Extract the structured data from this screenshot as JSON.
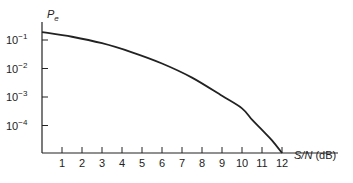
{
  "chart_data": {
    "type": "line",
    "title": "",
    "xlabel": "S/N (dB)",
    "ylabel": "P_e",
    "yscale": "log",
    "xlim": [
      0,
      12.8
    ],
    "ylim": [
      1e-05,
      0.3
    ],
    "x_ticks": [
      1,
      2,
      3,
      4,
      5,
      6,
      7,
      8,
      9,
      10,
      11,
      12
    ],
    "y_ticks": [
      {
        "value": 0.1,
        "label_base": "10",
        "label_exp": "−1"
      },
      {
        "value": 0.01,
        "label_base": "10",
        "label_exp": "−2"
      },
      {
        "value": 0.001,
        "label_base": "10",
        "label_exp": "−3"
      },
      {
        "value": 0.0001,
        "label_base": "10",
        "label_exp": "−4"
      }
    ],
    "grid": false,
    "legend": null,
    "series": [
      {
        "name": "P_e",
        "x": [
          0,
          1.5,
          3,
          4.5,
          6,
          7.5,
          9,
          10,
          10.5,
          11,
          11.5,
          12
        ],
        "values": [
          0.19,
          0.13,
          0.077,
          0.037,
          0.015,
          0.0048,
          0.0011,
          0.0004,
          0.00016,
          7e-05,
          3e-05,
          1e-05
        ]
      }
    ]
  },
  "labels": {
    "y_axis": {
      "base": "P",
      "sub": "e"
    },
    "x_axis": {
      "main": "S/N",
      "unit": " (dB)"
    }
  }
}
